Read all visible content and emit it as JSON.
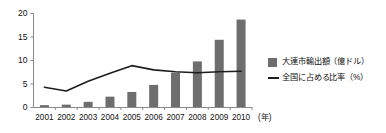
{
  "chart_data": {
    "type": "bar",
    "title": "",
    "subtitle": "",
    "xlabel": "(年)",
    "ylabel": "",
    "ylim": [
      0,
      20
    ],
    "yticks": [
      0,
      5,
      10,
      15,
      20
    ],
    "ytick_labels": [
      "0",
      "5",
      "10",
      "15",
      "20"
    ],
    "grid": false,
    "legend_position": "right",
    "categories": [
      "2001",
      "2002",
      "2003",
      "2004",
      "2005",
      "2006",
      "2007",
      "2008",
      "2009",
      "2010"
    ],
    "series": [
      {
        "name": "大連市輸出額（億ドル）",
        "type": "bar",
        "color": "#6e6e6e",
        "values": [
          0.4,
          0.5,
          1.1,
          2.2,
          3.2,
          4.7,
          7.3,
          9.7,
          14.3,
          18.6
        ]
      },
      {
        "name": "全国に占める比率（%）",
        "type": "line",
        "color": "#1d1d1d",
        "values": [
          4.2,
          3.4,
          5.5,
          7.2,
          8.8,
          7.9,
          7.5,
          7.3,
          7.5,
          7.6
        ]
      }
    ]
  },
  "axes": {
    "x_unit_label": "(年)",
    "y_tick_0": "0",
    "y_tick_1": "5",
    "y_tick_2": "10",
    "y_tick_3": "15",
    "y_tick_4": "20"
  },
  "legend": {
    "items": [
      {
        "label": "大連市輸出額（億ドル）",
        "marker": "bar-swatch-icon"
      },
      {
        "label": "全国に占める比率（%）",
        "marker": "line-swatch-icon"
      }
    ]
  },
  "colors": {
    "bar": "#6e6e6e",
    "line": "#1d1d1d",
    "axis": "#8a8a8a",
    "text": "#111111",
    "background": "#ffffff"
  }
}
